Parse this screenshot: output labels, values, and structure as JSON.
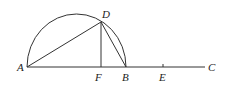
{
  "diagram": {
    "type": "geometry",
    "colors": {
      "stroke": "#333333",
      "label": "#222222",
      "background": "#ffffff"
    },
    "points": {
      "A": {
        "label": "A",
        "x": 27,
        "y": 67
      },
      "F": {
        "label": "F",
        "x": 100,
        "y": 67
      },
      "B": {
        "label": "B",
        "x": 126,
        "y": 67
      },
      "E": {
        "label": "E",
        "x": 163,
        "y": 67
      },
      "C": {
        "label": "C",
        "x": 205,
        "y": 67
      },
      "D": {
        "label": "D",
        "x": 101,
        "y": 22
      }
    },
    "segments": [
      "AD",
      "DF",
      "DB",
      "AC"
    ],
    "arcs": [
      "semicircle AB"
    ]
  }
}
